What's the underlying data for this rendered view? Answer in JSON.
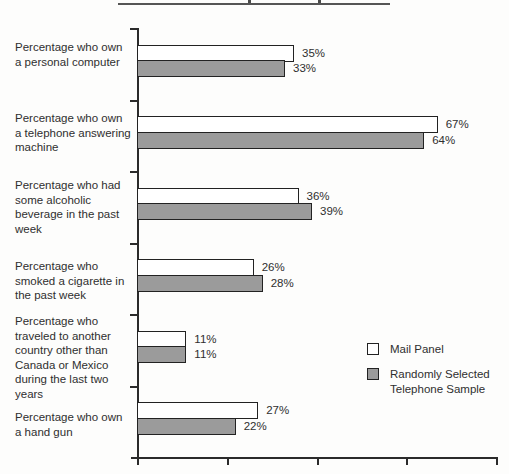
{
  "chart_data": {
    "type": "bar",
    "orientation": "horizontal",
    "title": "",
    "xlabel": "",
    "ylabel": "",
    "grid": false,
    "xlim": [
      0,
      80
    ],
    "x_tick_interval": 20,
    "legend_position": "right-middle",
    "value_suffix": "%",
    "categories": [
      "Percentage who own a personal computer",
      "Percentage who own a telephone answering machine",
      "Percentage who had some alcoholic beverage in the past week",
      "Percentage who smoked a cigarette in the past week",
      "Percentage who traveled to another country other than Canada or Mexico during the last two years",
      "Percentage who own a hand gun"
    ],
    "series": [
      {
        "name": "Mail Panel",
        "fill": "#ffffff",
        "values": [
          35,
          67,
          36,
          26,
          11,
          27
        ],
        "value_labels": [
          "35%",
          "67%",
          "36%",
          "26%",
          "11%",
          "27%"
        ]
      },
      {
        "name": "Randomly Selected Telephone Sample",
        "fill": "#9b9b9b",
        "values": [
          33,
          64,
          39,
          28,
          11,
          22
        ],
        "value_labels": [
          "33%",
          "64%",
          "39%",
          "28%",
          "11%",
          "22%"
        ]
      }
    ]
  },
  "legend": {
    "items": [
      {
        "label": "Mail Panel",
        "swatch": "#ffffff"
      },
      {
        "label": "Randomly Selected Telephone Sample",
        "swatch": "#9b9b9b"
      }
    ]
  },
  "colors": {
    "axis": "#2b2b2b",
    "bar_border": "#222222",
    "bar_white_fill": "#ffffff",
    "bar_gray_fill": "#9b9b9b",
    "text": "#2f2f2f"
  }
}
